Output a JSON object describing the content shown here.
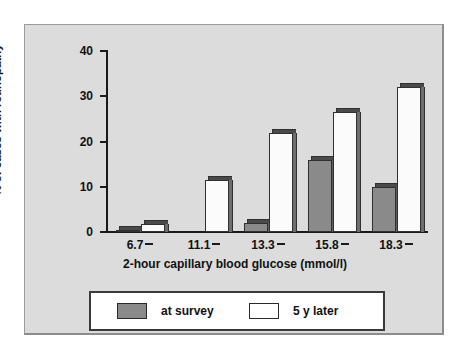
{
  "chart_data": {
    "type": "bar",
    "title": "",
    "xlabel": "2-hour capillary blood glucose (mmol/l)",
    "ylabel": "% of cases with retinopathy",
    "categories": [
      "6.7",
      "11.1",
      "13.3",
      "15.8",
      "18.3"
    ],
    "series": [
      {
        "name": "at survey",
        "color": "#8a8a8a",
        "values": [
          0.5,
          0,
          2.0,
          16.0,
          10.0
        ]
      },
      {
        "name": "5 y later",
        "color": "#ffffff",
        "values": [
          1.8,
          11.5,
          21.8,
          26.5,
          32.0
        ]
      }
    ],
    "ylim": [
      0,
      40
    ],
    "yticks": [
      "0",
      "10",
      "20",
      "30",
      "40"
    ],
    "ytick_values": [
      0,
      10,
      20,
      30,
      40
    ],
    "grid": false,
    "legend_position": "bottom"
  },
  "legend": {
    "items": [
      {
        "label": "at survey"
      },
      {
        "label": "5 y later"
      }
    ]
  }
}
